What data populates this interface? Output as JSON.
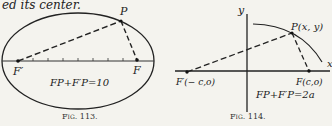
{
  "header_fragment": "ed its center.",
  "figures": [
    {
      "id": "fig113",
      "caption": "Fig. 113.",
      "labels": {
        "p": "P",
        "f": "F",
        "f_prime": "F′"
      },
      "equation": "FP+F′P=10",
      "ellipse": {
        "cx": 78,
        "cy": 61,
        "rx": 76,
        "ry": 48
      },
      "points": {
        "f_prime": [
          18,
          61
        ],
        "f": [
          137,
          60
        ],
        "p": [
          121,
          21
        ]
      },
      "ticks_x": [
        33,
        48,
        63,
        78,
        93,
        108,
        123
      ]
    },
    {
      "id": "fig114",
      "caption": "Fig. 114.",
      "labels": {
        "y_axis": "y",
        "x_axis": "x",
        "p": "P(x, y)",
        "f": "F(c,o)",
        "f_prime": "F′(− c,o)"
      },
      "equation": "FP+F′P=2a",
      "points": {
        "f_prime": [
          187,
          72
        ],
        "f": [
          309,
          71
        ],
        "p": [
          292,
          33
        ]
      },
      "axes": {
        "y_axis_x": 247,
        "x_axis_y": 71
      }
    }
  ],
  "colors": {
    "ink": "#222222",
    "paper": "#f4f3ee"
  }
}
